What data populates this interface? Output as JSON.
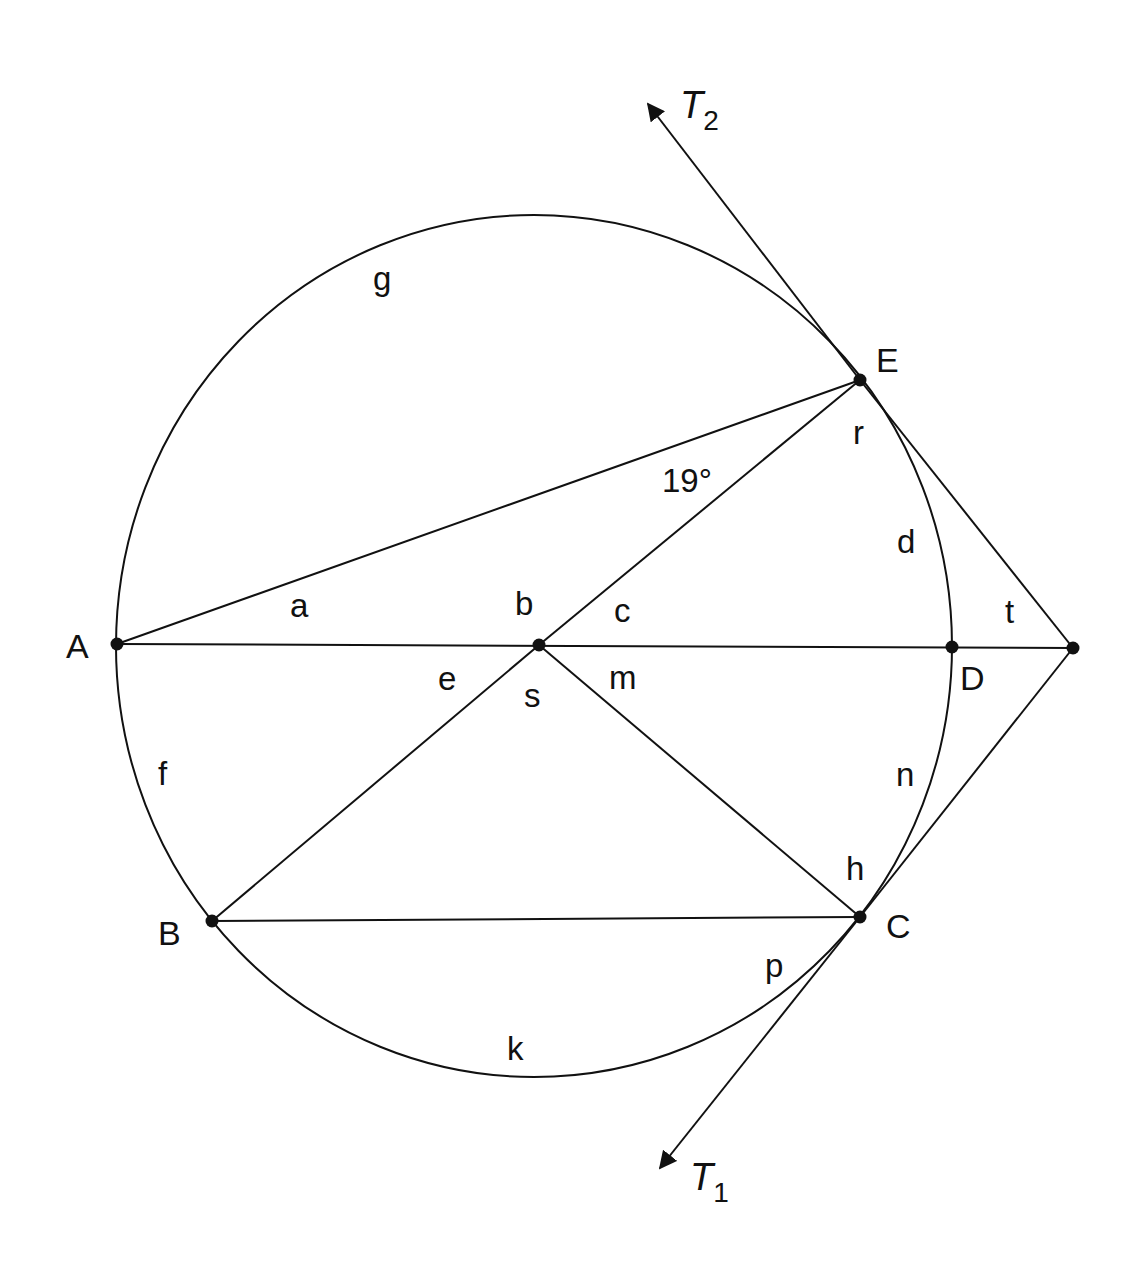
{
  "figure": {
    "type": "circle-geometry",
    "circle": {
      "cx": 534,
      "cy": 646,
      "rx": 418,
      "ry": 431
    },
    "points": [
      {
        "id": "A",
        "label": "A",
        "x": 117,
        "y": 644,
        "lx": 66,
        "ly": 658
      },
      {
        "id": "O",
        "label": "",
        "x": 539,
        "y": 645,
        "lx": 0,
        "ly": 0
      },
      {
        "id": "D",
        "label": "D",
        "x": 952,
        "y": 647,
        "lx": 960,
        "ly": 690
      },
      {
        "id": "P",
        "label": "",
        "x": 1073,
        "y": 648,
        "lx": 0,
        "ly": 0
      },
      {
        "id": "E",
        "label": "E",
        "x": 860,
        "y": 380,
        "lx": 876,
        "ly": 372
      },
      {
        "id": "B",
        "label": "B",
        "x": 212,
        "y": 921,
        "lx": 158,
        "ly": 945
      },
      {
        "id": "C",
        "label": "C",
        "x": 860,
        "y": 917,
        "lx": 886,
        "ly": 938
      }
    ],
    "segments": [
      {
        "from": "A",
        "to": "P"
      },
      {
        "from": "A",
        "to": "E"
      },
      {
        "from": "O",
        "to": "E"
      },
      {
        "from": "O",
        "to": "B"
      },
      {
        "from": "O",
        "to": "C"
      },
      {
        "from": "B",
        "to": "C"
      },
      {
        "from": "E",
        "to": "P"
      },
      {
        "from": "C",
        "to": "P"
      }
    ],
    "tangents": [
      {
        "id": "T2",
        "label": "T",
        "subscript": "2",
        "x1": 860,
        "y1": 380,
        "x2": 648,
        "y2": 104,
        "lx": 680,
        "ly": 118
      },
      {
        "id": "T1",
        "label": "T",
        "subscript": "1",
        "x1": 860,
        "y1": 917,
        "x2": 660,
        "y2": 1168,
        "lx": 690,
        "ly": 1190
      }
    ],
    "angle_labels": [
      {
        "id": "a",
        "text": "a",
        "x": 290,
        "y": 617
      },
      {
        "id": "b",
        "text": "b",
        "x": 515,
        "y": 615
      },
      {
        "id": "c",
        "text": "c",
        "x": 614,
        "y": 622
      },
      {
        "id": "19deg",
        "text": "19°",
        "x": 662,
        "y": 492
      },
      {
        "id": "r",
        "text": "r",
        "x": 853,
        "y": 444
      },
      {
        "id": "d",
        "text": "d",
        "x": 897,
        "y": 553
      },
      {
        "id": "t",
        "text": "t",
        "x": 1005,
        "y": 623
      },
      {
        "id": "e",
        "text": "e",
        "x": 438,
        "y": 690
      },
      {
        "id": "s",
        "text": "s",
        "x": 524,
        "y": 707
      },
      {
        "id": "m",
        "text": "m",
        "x": 609,
        "y": 689
      },
      {
        "id": "f",
        "text": "f",
        "x": 158,
        "y": 785
      },
      {
        "id": "n",
        "text": "n",
        "x": 896,
        "y": 786
      },
      {
        "id": "h",
        "text": "h",
        "x": 846,
        "y": 880
      },
      {
        "id": "p",
        "text": "p",
        "x": 765,
        "y": 977
      },
      {
        "id": "k",
        "text": "k",
        "x": 507,
        "y": 1060
      },
      {
        "id": "g",
        "text": "g",
        "x": 373,
        "y": 290
      }
    ]
  }
}
